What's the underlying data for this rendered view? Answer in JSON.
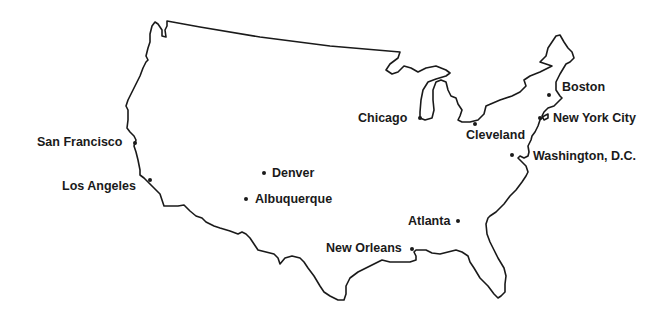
{
  "map": {
    "title": "United States outline map with major cities",
    "outline_color": "#1a1a1a",
    "background": "#ffffff"
  },
  "cities": [
    {
      "name": "San Francisco",
      "dot": [
        135,
        143
      ],
      "label_pos": [
        37,
        137
      ],
      "align": "left"
    },
    {
      "name": "Los Angeles",
      "dot": [
        150,
        180
      ],
      "label_pos": [
        62,
        181
      ],
      "align": "left"
    },
    {
      "name": "Denver",
      "dot": [
        264,
        173
      ],
      "label_pos": [
        272,
        167
      ],
      "align": "right"
    },
    {
      "name": "Albuquerque",
      "dot": [
        246,
        199
      ],
      "label_pos": [
        255,
        192
      ],
      "align": "right"
    },
    {
      "name": "Chicago",
      "dot": [
        420,
        118
      ],
      "label_pos": [
        358,
        112
      ],
      "align": "left"
    },
    {
      "name": "Cleveland",
      "dot": [
        475,
        124
      ],
      "label_pos": [
        466,
        130
      ],
      "align": "below"
    },
    {
      "name": "Boston",
      "dot": [
        549,
        95
      ],
      "label_pos": [
        562,
        81
      ],
      "align": "right"
    },
    {
      "name": "New York City",
      "dot": [
        540,
        118
      ],
      "label_pos": [
        553,
        112
      ],
      "align": "right"
    },
    {
      "name": "Washington, D.C.",
      "dot": [
        512,
        155
      ],
      "label_pos": [
        533,
        150
      ],
      "align": "right"
    },
    {
      "name": "Atlanta",
      "dot": [
        458,
        221
      ],
      "label_pos": [
        408,
        214
      ],
      "align": "left"
    },
    {
      "name": "New Orleans",
      "dot": [
        412,
        249
      ],
      "label_pos": [
        326,
        243
      ],
      "align": "left"
    }
  ]
}
